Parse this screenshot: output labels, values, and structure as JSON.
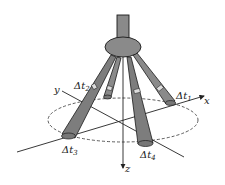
{
  "diagram": {
    "type": "3d-schematic",
    "axes": {
      "x": {
        "label": "x"
      },
      "y": {
        "label": "y"
      },
      "z": {
        "label": "z"
      }
    },
    "legs": [
      {
        "id": "leg-1",
        "label": "Δt",
        "subscript": "1"
      },
      {
        "id": "leg-2",
        "label": "Δt",
        "subscript": "2"
      },
      {
        "id": "leg-3",
        "label": "Δt",
        "subscript": "3"
      },
      {
        "id": "leg-4",
        "label": "Δt",
        "subscript": "4"
      }
    ],
    "colors": {
      "fill": "#8a8a8a",
      "stroke": "#1a1a1a",
      "background": "#ffffff"
    }
  }
}
